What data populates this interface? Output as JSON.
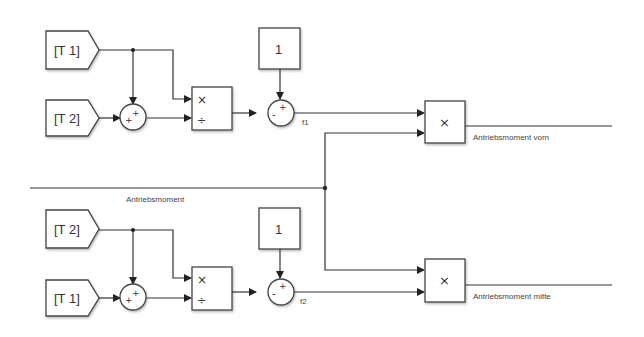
{
  "diagram": {
    "type": "simulink-block-diagram",
    "signals": {
      "main_input": "Antriebsmoment",
      "output_front": "Antriebsmoment vorn",
      "output_middle": "Antriebsmoment mitte",
      "f1": "f1",
      "f2": "f2"
    },
    "top_branch": {
      "from_tag_a": "[T 1]",
      "from_tag_b": "[T 2]",
      "sum_signs": "++",
      "product_top": "×",
      "product_bottom": "÷",
      "constant": "1",
      "subtract_signs": "-+",
      "output_label": "f1"
    },
    "bottom_branch": {
      "from_tag_a": "[T 2]",
      "from_tag_b": "[T 1]",
      "sum_signs": "++",
      "product_top": "×",
      "product_bottom": "÷",
      "constant": "1",
      "subtract_signs": "-+",
      "output_label": "f2"
    },
    "product_front": {
      "symbol": "×",
      "output_label": "Antriebsmoment vorn"
    },
    "product_middle": {
      "symbol": "×",
      "output_label": "Antriebsmoment mitte"
    }
  }
}
